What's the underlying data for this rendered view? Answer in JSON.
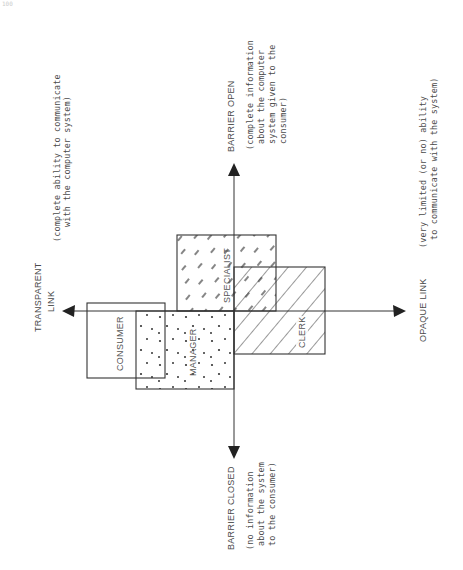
{
  "page_mark": "100",
  "axes": {
    "left": {
      "title_line1": "TRANSPARENT",
      "title_line2": "LINK",
      "description_line1": "(complete ability to communicate",
      "description_line2": "with the computer system)"
    },
    "right": {
      "title": "OPAQUE LINK",
      "description_line1": "(very limited (or no) ability",
      "description_line2": "to communicate with the system)"
    },
    "top": {
      "title": "BARRIER OPEN",
      "description_line1": "(complete information",
      "description_line2": "about the computer",
      "description_line3": "system given to the",
      "description_line4": "consumer)"
    },
    "bottom": {
      "title": "BARRIER CLOSED",
      "description_line1": "(no information",
      "description_line2": "about the system",
      "description_line3": "to the consumer)"
    }
  },
  "regions": [
    {
      "label": "CONSUMER",
      "fill": "none"
    },
    {
      "label": "MANAGER",
      "fill": "dots"
    },
    {
      "label": "SPECIALIST",
      "fill": "sparse-dashes"
    },
    {
      "label": "CLERK",
      "fill": "diagonal-hatch"
    }
  ],
  "colors": {
    "ink": "#333333",
    "text": "#4a4a4a",
    "background": "#ffffff"
  }
}
